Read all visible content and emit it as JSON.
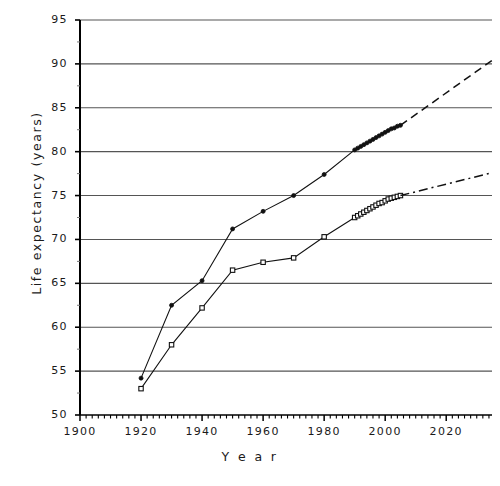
{
  "chart_data": {
    "type": "line",
    "title": "",
    "xlabel": "Year",
    "ylabel": "Life expectancy  (years)",
    "xlim": [
      1900,
      2035
    ],
    "ylim": [
      50,
      95
    ],
    "xticks": [
      1900,
      1920,
      1940,
      1960,
      1980,
      2000,
      2020
    ],
    "yticks": [
      50,
      55,
      60,
      65,
      70,
      75,
      80,
      85,
      90,
      95
    ],
    "grid": true,
    "legend": "none",
    "series": [
      {
        "name": "upper-series",
        "marker": "filled-circle",
        "linestyle": "solid",
        "x": [
          1920,
          1930,
          1940,
          1950,
          1960,
          1970,
          1980,
          1990,
          1991,
          1992,
          1993,
          1994,
          1995,
          1996,
          1997,
          1998,
          1999,
          2000,
          2001,
          2002,
          2003,
          2004,
          2005
        ],
        "y": [
          54.2,
          62.5,
          65.3,
          71.2,
          73.2,
          75.0,
          77.4,
          80.2,
          80.4,
          80.6,
          80.8,
          81.0,
          81.2,
          81.4,
          81.6,
          81.8,
          82.0,
          82.2,
          82.4,
          82.6,
          82.7,
          82.9,
          83.0
        ]
      },
      {
        "name": "lower-series",
        "marker": "open-square",
        "linestyle": "solid",
        "x": [
          1920,
          1930,
          1940,
          1950,
          1960,
          1970,
          1980,
          1990,
          1991,
          1992,
          1993,
          1994,
          1995,
          1996,
          1997,
          1998,
          1999,
          2000,
          2001,
          2002,
          2003,
          2004,
          2005
        ],
        "y": [
          53.0,
          58.0,
          62.2,
          66.5,
          67.4,
          67.9,
          70.3,
          72.5,
          72.7,
          72.9,
          73.1,
          73.3,
          73.5,
          73.7,
          73.9,
          74.1,
          74.2,
          74.4,
          74.6,
          74.7,
          74.8,
          74.9,
          75.0
        ]
      }
    ],
    "extrapolations": [
      {
        "name": "upper-extrapolation",
        "linestyle": "dashed",
        "x": [
          2005,
          2035
        ],
        "y": [
          83.0,
          90.4
        ]
      },
      {
        "name": "lower-extrapolation",
        "linestyle": "dash-dot",
        "x": [
          2005,
          2035
        ],
        "y": [
          75.0,
          77.6
        ]
      }
    ]
  },
  "ytick_labels": [
    "95",
    "90",
    "85",
    "80",
    "75",
    "70",
    "65",
    "60",
    "55",
    "50"
  ],
  "xtick_labels": [
    "1900",
    "1920",
    "1940",
    "1960",
    "1980",
    "2000",
    "2020"
  ],
  "axis": {
    "y_title": "Life  expectancy   (years)",
    "x_title": "Y e a r"
  },
  "colors": {
    "line": "#111111",
    "grid": "#555555",
    "axis": "#000000",
    "background": "#ffffff"
  }
}
